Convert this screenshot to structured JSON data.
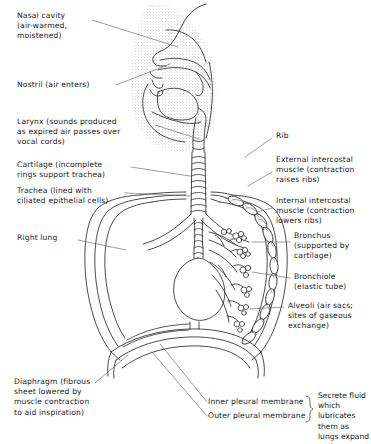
{
  "figure": {
    "ink_color": "#2b2b2b",
    "stipple_color": "#8d8d8d",
    "background": "#ffffff"
  },
  "labels": {
    "nasal_cavity": "Nasal cavity\n(air-warmed,\nmoistened)",
    "nostril": "Nostril (air enters)",
    "larynx": "Larynx (sounds produced\nas expired air passes over\nvocal cords)",
    "cartilage": "Cartilage (incomplete\nrings support trachea)",
    "trachea": "Trachea (lined with\nciliated epithelial cells)",
    "right_lung": "Right lung",
    "diaphragm": "Diaphragm (fibrous\nsheet lowered by\nmuscle contraction\nto aid inspiration)",
    "rib": "Rib",
    "external_intercostal": "External intercostal\nmuscle (contraction\nraises ribs)",
    "internal_intercostal": "Internal intercostal\nmuscle (contraction\nlowers ribs)",
    "bronchus": "Bronchus\n(supported by\ncartilage)",
    "bronchiole": "Bronchiole\n(elastic tube)",
    "alveoli": "Alveoli (air sacs;\nsites of gaseous\nexchange)",
    "inner_pleural_membrane": "Inner pleural membrane",
    "outer_pleural_membrane": "Outer pleural membrane",
    "pleural_note": "Secrete fluid which\nlubricates them as\nlungs expand and\ncontract"
  },
  "structures": [
    "nasal-cavity",
    "nostril",
    "hard-palate",
    "tongue",
    "epiglottis",
    "larynx",
    "trachea",
    "cartilage-rings",
    "left-lung",
    "right-lung",
    "bronchus",
    "bronchiole",
    "alveoli",
    "ribs",
    "intercostal-muscles",
    "diaphragm",
    "inner-pleural-membrane",
    "outer-pleural-membrane"
  ]
}
